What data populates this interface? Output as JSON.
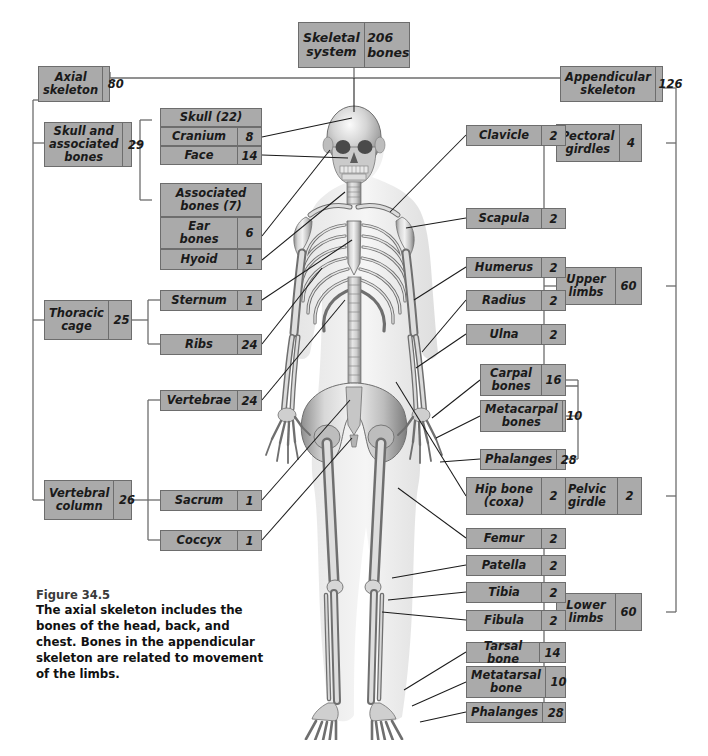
{
  "figure": {
    "number": "Figure 34.5",
    "caption": "The axial skeleton includes the bones of the head, back, and chest. Bones in the appendicular skeleton are related to movement of the limbs."
  },
  "colors": {
    "box_fill": "#aaaaaa",
    "box_border": "#6d6d6d",
    "line": "#1a1a1a",
    "page_background": "#ffffff"
  },
  "root": {
    "label": "Skeletal\nsystem",
    "label_line1": "Skeletal",
    "label_line2": "system",
    "value": "206",
    "value_unit": "bones"
  },
  "axial": {
    "label_line1": "Axial",
    "label_line2": "skeleton",
    "value": "80",
    "groups": [
      {
        "name": "skull-and-associated-bones",
        "label_line1": "Skull and",
        "label_line2": "associated",
        "label_line3": "bones",
        "value": "29",
        "subgroups": [
          {
            "name": "skull",
            "header": "Skull (22)",
            "items": [
              {
                "label": "Cranium",
                "value": "8"
              },
              {
                "label": "Face",
                "value": "14"
              }
            ]
          },
          {
            "name": "associated-bones",
            "header_line1": "Associated",
            "header_line2": "bones (7)",
            "items": [
              {
                "label_line1": "Ear",
                "label_line2": "bones",
                "value": "6"
              },
              {
                "label": "Hyoid",
                "value": "1"
              }
            ]
          }
        ]
      },
      {
        "name": "thoracic-cage",
        "label_line1": "Thoracic",
        "label_line2": "cage",
        "value": "25",
        "items": [
          {
            "label": "Sternum",
            "value": "1"
          },
          {
            "label": "Ribs",
            "value": "24"
          }
        ]
      },
      {
        "name": "vertebral-column",
        "label_line1": "Vertebral",
        "label_line2": "column",
        "value": "26",
        "items": [
          {
            "label": "Vertebrae",
            "value": "24"
          },
          {
            "label": "Sacrum",
            "value": "1"
          },
          {
            "label": "Coccyx",
            "value": "1"
          }
        ]
      }
    ]
  },
  "appendicular": {
    "label_line1": "Appendicular",
    "label_line2": "skeleton",
    "value": "126",
    "groups": [
      {
        "name": "pectoral-girdles",
        "label_line1": "Pectoral",
        "label_line2": "girdles",
        "value": "4",
        "items": [
          {
            "label": "Clavicle",
            "value": "2"
          },
          {
            "label": "Scapula",
            "value": "2"
          }
        ]
      },
      {
        "name": "upper-limbs",
        "label_line1": "Upper",
        "label_line2": "limbs",
        "value": "60",
        "items": [
          {
            "label": "Humerus",
            "value": "2"
          },
          {
            "label": "Radius",
            "value": "2"
          },
          {
            "label": "Ulna",
            "value": "2"
          },
          {
            "label_line1": "Carpal",
            "label_line2": "bones",
            "value": "16"
          },
          {
            "label_line1": "Metacarpal",
            "label_line2": "bones",
            "value": "10"
          },
          {
            "label": "Phalanges",
            "value": "28"
          }
        ]
      },
      {
        "name": "pelvic-girdle",
        "label_line1": "Pelvic",
        "label_line2": "girdle",
        "value": "2",
        "items": [
          {
            "label_line1": "Hip bone",
            "label_line2": "(coxa)",
            "value": "2"
          }
        ]
      },
      {
        "name": "lower-limbs",
        "label_line1": "Lower",
        "label_line2": "limbs",
        "value": "60",
        "items": [
          {
            "label": "Femur",
            "value": "2"
          },
          {
            "label": "Patella",
            "value": "2"
          },
          {
            "label": "Tibia",
            "value": "2"
          },
          {
            "label": "Fibula",
            "value": "2"
          },
          {
            "label": "Tarsal bone",
            "value": "14"
          },
          {
            "label_line1": "Metatarsal",
            "label_line2": "bone",
            "value": "10"
          },
          {
            "label": "Phalanges",
            "value": "28"
          }
        ]
      }
    ]
  },
  "illustration": {
    "name": "human-skeleton-anterior-view",
    "description": "Grayscale anterior view of full human skeleton"
  }
}
